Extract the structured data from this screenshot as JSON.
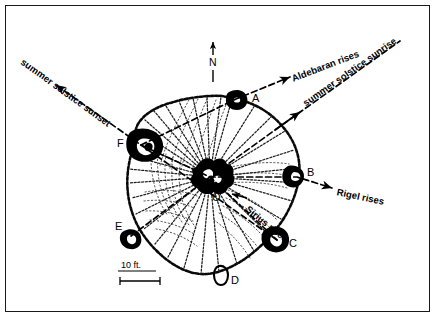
{
  "figure": {
    "type": "archaeoastronomy-site-plan",
    "north_arrow": {
      "label": "N"
    },
    "scale_bar": {
      "label": "10 ft."
    }
  },
  "cairns": [
    {
      "id": "A",
      "label": "A",
      "position": "north-northeast rim",
      "x": 236,
      "y": 97,
      "label_x": 252,
      "label_y": 99
    },
    {
      "id": "B",
      "label": "B",
      "position": "east rim",
      "x": 297,
      "y": 177,
      "label_x": 307,
      "label_y": 173
    },
    {
      "id": "C",
      "label": "C",
      "position": "southeast rim",
      "x": 277,
      "y": 240,
      "label_x": 288,
      "label_y": 244
    },
    {
      "id": "D",
      "label": "D",
      "position": "south rim",
      "x": 223,
      "y": 272,
      "label_x": 231,
      "label_y": 281
    },
    {
      "id": "E",
      "label": "E",
      "position": "southwest rim",
      "x": 131,
      "y": 236,
      "label_x": 119,
      "label_y": 227
    },
    {
      "id": "F",
      "label": "F",
      "position": "west-northwest rim",
      "x": 141,
      "y": 145,
      "label_x": 120,
      "label_y": 145
    },
    {
      "id": "O",
      "label": "O",
      "position": "center hub",
      "x": 210,
      "y": 177,
      "label_x": 214,
      "label_y": 198
    }
  ],
  "alignments": [
    {
      "id": "summer-solstice-sunset",
      "label": "summer solstice sunset",
      "from_cairn": "C",
      "to_cairn": "F",
      "direction": "northwest",
      "label_angle_deg": -40,
      "label_x": 22,
      "label_y": 56
    },
    {
      "id": "aldebaran-rises",
      "label": "Aldebaran rises",
      "from_cairn": "F",
      "to_cairn": "A",
      "direction": "east-northeast",
      "label_angle_deg": -16,
      "label_x": 292,
      "label_y": 74
    },
    {
      "id": "summer-solstice-sunrise",
      "label": "summer solstice sunrise",
      "from_cairn": "E",
      "to_cairn": "O",
      "direction": "northeast",
      "label_angle_deg": -22,
      "label_x": 306,
      "label_y": 97
    },
    {
      "id": "rigel-rises",
      "label": "Rigel rises",
      "from_cairn": "F",
      "to_cairn": "B",
      "direction": "east-southeast",
      "label_angle_deg": 10,
      "label_x": 334,
      "label_y": 186
    },
    {
      "id": "sirius-rises",
      "label": "Sirius rises",
      "from_cairn": "O",
      "to_cairn": "C",
      "direction": "southeast",
      "label_angle_deg": 38,
      "label_x": 248,
      "label_y": 205
    }
  ],
  "colors": {
    "ink": "#000000",
    "frame": "#1a1a1a",
    "background": "#ffffff"
  }
}
